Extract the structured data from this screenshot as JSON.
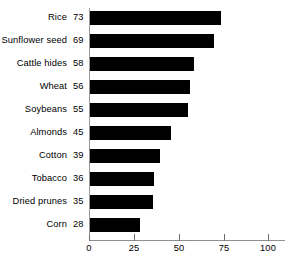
{
  "chart_data": {
    "type": "bar",
    "orientation": "horizontal",
    "title": "",
    "subtitle": "",
    "xlabel": "",
    "ylabel": "",
    "categories": [
      "Rice",
      "Sunflower seed",
      "Cattle hides",
      "Wheat",
      "Soybeans",
      "Almonds",
      "Cotton",
      "Tobacco",
      "Dried prunes",
      "Corn"
    ],
    "values": [
      73,
      69,
      58,
      56,
      55,
      45,
      39,
      36,
      35,
      28
    ],
    "value_labels": [
      "73",
      "69",
      "58",
      "56",
      "55",
      "45",
      "39",
      "36",
      "35",
      "28"
    ],
    "xlim": [
      0,
      100
    ],
    "xticks": [
      0,
      25,
      50,
      75,
      100
    ],
    "xtick_labels": [
      "0",
      "25",
      "50",
      "75",
      "100"
    ],
    "grid": false,
    "legend": null,
    "bar_color": "#000000",
    "axis_color": "#8f8f8f",
    "background_color": "#ffffff"
  }
}
